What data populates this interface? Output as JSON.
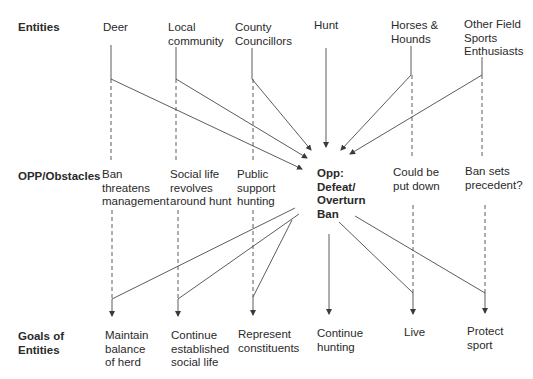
{
  "rows": {
    "entities": "Entities",
    "obstacles": "OPP/Obstacles",
    "goals_line1": "Goals of",
    "goals_line2": "Entities"
  },
  "entities": [
    {
      "id": "deer",
      "lines": [
        "Deer"
      ]
    },
    {
      "id": "local-community",
      "lines": [
        "Local",
        "community"
      ]
    },
    {
      "id": "county-councillors",
      "lines": [
        "County",
        "Councillors"
      ]
    },
    {
      "id": "hunt",
      "lines": [
        "Hunt"
      ]
    },
    {
      "id": "horses-hounds",
      "lines": [
        "Horses &",
        "Hounds"
      ]
    },
    {
      "id": "other-field-sports",
      "lines": [
        "Other Field",
        "Sports",
        "Enthusiasts"
      ]
    }
  ],
  "obstacles": [
    {
      "id": "ban-threatens-management",
      "lines": [
        "Ban",
        "threatens",
        "management"
      ]
    },
    {
      "id": "social-life",
      "lines": [
        "Social life",
        "revolves",
        "around hunt"
      ]
    },
    {
      "id": "public-support",
      "lines": [
        "Public",
        "support",
        "hunting"
      ]
    },
    {
      "id": "opp-defeat-ban",
      "lines": [
        "Opp:",
        "Defeat/",
        "Overturn",
        "Ban"
      ],
      "bold": true
    },
    {
      "id": "could-be-put-down",
      "lines": [
        "Could be",
        "put down"
      ]
    },
    {
      "id": "ban-sets-precedent",
      "lines": [
        "Ban sets",
        "precedent?"
      ]
    }
  ],
  "goals": [
    {
      "id": "maintain-balance",
      "lines": [
        "Maintain",
        "balance",
        "of herd"
      ]
    },
    {
      "id": "continue-social-life",
      "lines": [
        "Continue",
        "established",
        "social life"
      ]
    },
    {
      "id": "represent-constituents",
      "lines": [
        "Represent",
        "constituents"
      ]
    },
    {
      "id": "continue-hunting",
      "lines": [
        "Continue",
        "hunting"
      ]
    },
    {
      "id": "live",
      "lines": [
        "Live"
      ]
    },
    {
      "id": "protect-sport",
      "lines": [
        "Protect",
        "sport"
      ]
    }
  ],
  "colors": {
    "line": "#4a4a4a",
    "text": "#2a2a2a"
  }
}
